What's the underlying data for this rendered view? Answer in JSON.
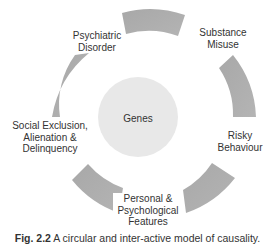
{
  "diagram": {
    "center": {
      "label": "Genes",
      "color": "#e6e6e6"
    },
    "arc_color": "#aaaaaa",
    "nodes": [
      {
        "id": "psychiatric",
        "lines": [
          "Psychiatric",
          "Disorder"
        ]
      },
      {
        "id": "substance",
        "lines": [
          "Substance",
          "Misuse"
        ]
      },
      {
        "id": "risky",
        "lines": [
          "Risky",
          "Behaviour"
        ]
      },
      {
        "id": "personal",
        "lines": [
          "Personal &",
          "Psychological",
          "Features"
        ]
      },
      {
        "id": "social",
        "lines": [
          "Social Exclusion,",
          "Alienation &",
          "Delinquency"
        ]
      }
    ]
  },
  "caption": {
    "label": "Fig. 2.2",
    "text": " A circular and inter-active model of causality."
  }
}
